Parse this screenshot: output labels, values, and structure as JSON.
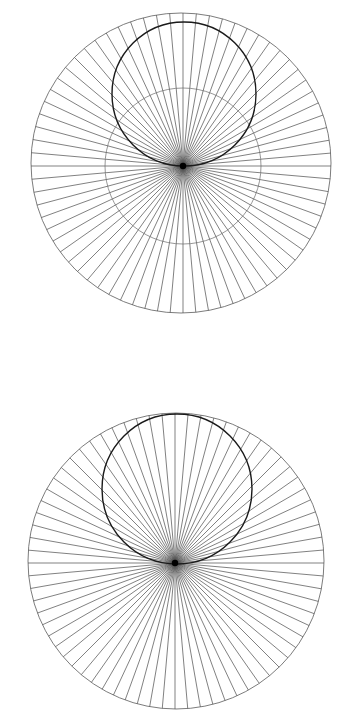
{
  "document": {
    "title": "Radial Circle Diagrams",
    "background_color": "#ffffff",
    "width": 345,
    "height": 727,
    "figure_count": 2,
    "description": "Two geometric line diagrams, each a circle filled with radiating straight lines converging on a single off-centre point, with a bold secondary circle passing through that point."
  },
  "style": {
    "ray_color": "#4a4a4a",
    "ray_width": 0.7,
    "outer_circle_color": "#5a5a5a",
    "outer_circle_width": 0.8,
    "bold_circle_color": "#1a1a1a",
    "bold_circle_width": 1.4,
    "mid_circle_color": "#6a6a6a",
    "mid_circle_width": 0.7,
    "hub_color": "#000000"
  },
  "figures": [
    {
      "id": "figure-top",
      "name": "upper-radial-diagram",
      "label": "Upper radial diagram",
      "panel": {
        "x": 0,
        "y": 0,
        "width": 345,
        "height": 360
      },
      "outer_circle": {
        "cx": 181,
        "cy": 163,
        "r": 150
      },
      "hub": {
        "cx": 183,
        "cy": 166,
        "dot_r": 3.2
      },
      "bold_circle": {
        "cx": 184,
        "cy": 94,
        "r": 72
      },
      "mid_circle": {
        "cx": 183,
        "cy": 166,
        "r": 78
      },
      "rays": {
        "count": 72,
        "step_degrees": 5,
        "start_degrees": 0
      },
      "has_mid_circle": true
    },
    {
      "id": "figure-bottom",
      "name": "lower-radial-diagram",
      "label": "Lower radial diagram",
      "panel": {
        "x": 0,
        "y": 360,
        "width": 345,
        "height": 367
      },
      "outer_circle": {
        "cx": 176,
        "cy": 561,
        "r": 148
      },
      "hub": {
        "cx": 175,
        "cy": 563,
        "dot_r": 3.2
      },
      "bold_circle": {
        "cx": 177,
        "cy": 489,
        "r": 75
      },
      "mid_circle": null,
      "rays": {
        "count": 72,
        "step_degrees": 5,
        "start_degrees": 0
      },
      "has_mid_circle": false
    }
  ],
  "chart_data": {
    "type": "line",
    "subtitle": "Pencil-of-lines through a point inside a circle",
    "xlabel": "",
    "ylabel": "",
    "grid": false,
    "legend": null,
    "annotations": [],
    "panels": [
      {
        "name": "upper",
        "elements": [
          {
            "kind": "circle",
            "role": "outer-boundary",
            "cx": 181,
            "cy": 163,
            "r": 150,
            "stroke": "#5a5a5a",
            "stroke_width": 0.8
          },
          {
            "kind": "circle",
            "role": "bold-circle-through-hub",
            "cx": 184,
            "cy": 94,
            "r": 72,
            "stroke": "#1a1a1a",
            "stroke_width": 1.4
          },
          {
            "kind": "circle",
            "role": "mid-circle-about-hub",
            "cx": 183,
            "cy": 166,
            "r": 78,
            "stroke": "#6a6a6a",
            "stroke_width": 0.7
          },
          {
            "kind": "ray-pencil",
            "role": "radiating-lines",
            "hub_x": 183,
            "hub_y": 166,
            "count": 72,
            "step_degrees": 5,
            "stroke": "#4a4a4a",
            "stroke_width": 0.7
          },
          {
            "kind": "point",
            "role": "hub-dot",
            "x": 183,
            "y": 166,
            "r": 3.2,
            "fill": "#000000"
          }
        ]
      },
      {
        "name": "lower",
        "elements": [
          {
            "kind": "circle",
            "role": "outer-boundary",
            "cx": 176,
            "cy": 561,
            "r": 148,
            "stroke": "#5a5a5a",
            "stroke_width": 0.8
          },
          {
            "kind": "circle",
            "role": "bold-circle-through-hub",
            "cx": 177,
            "cy": 489,
            "r": 75,
            "stroke": "#1a1a1a",
            "stroke_width": 1.4
          },
          {
            "kind": "ray-pencil",
            "role": "radiating-lines",
            "hub_x": 175,
            "hub_y": 563,
            "count": 72,
            "step_degrees": 5,
            "stroke": "#4a4a4a",
            "stroke_width": 0.7
          },
          {
            "kind": "point",
            "role": "hub-dot",
            "x": 175,
            "y": 563,
            "r": 3.2,
            "fill": "#000000"
          }
        ]
      }
    ]
  }
}
